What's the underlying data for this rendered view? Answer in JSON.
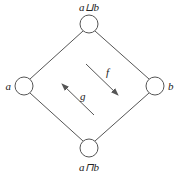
{
  "diagram": {
    "type": "lattice-diamond",
    "nodes": [
      {
        "id": "top",
        "label": "a⊔b",
        "cx": 89,
        "cy": 24
      },
      {
        "id": "left",
        "label": "a",
        "cx": 24,
        "cy": 86
      },
      {
        "id": "right",
        "label": "b",
        "cx": 155,
        "cy": 86
      },
      {
        "id": "bottom",
        "label": "a⊓b",
        "cx": 89,
        "cy": 148
      }
    ],
    "edges": [
      {
        "from": "top",
        "to": "left"
      },
      {
        "from": "top",
        "to": "right"
      },
      {
        "from": "left",
        "to": "bottom"
      },
      {
        "from": "right",
        "to": "bottom"
      }
    ],
    "arrows": [
      {
        "label": "f",
        "direction": "down-right"
      },
      {
        "label": "g",
        "direction": "up-left"
      }
    ],
    "colors": {
      "stroke": "#555555",
      "text": "#222222",
      "background": "#ffffff"
    }
  }
}
